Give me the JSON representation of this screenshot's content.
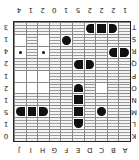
{
  "board": {
    "orientation_rotation_deg": 180,
    "columns": [
      "A",
      "B",
      "C",
      "D",
      "E",
      "F",
      "G",
      "H",
      "I",
      "J"
    ],
    "column_counts": [
      "1",
      "2",
      "2",
      "2",
      "5",
      "1",
      "0",
      "2",
      "1",
      "4"
    ],
    "rows": [
      "K",
      "L",
      "M",
      "N",
      "O",
      "P",
      "Q",
      "R",
      "S",
      "T"
    ],
    "row_counts": [
      "0",
      "1",
      "5",
      "1",
      "2",
      "1",
      "2",
      "4",
      "1",
      "3"
    ],
    "cells": [
      [
        "w",
        "w",
        "w",
        "w",
        "w",
        "w",
        "w",
        "w",
        "w",
        "w"
      ],
      [
        "w",
        "w",
        "w",
        "w",
        "st",
        "w",
        "w",
        "w",
        "w",
        "w"
      ],
      [
        "w",
        "w",
        "sub",
        "w",
        "sm",
        "w",
        "w",
        "sl",
        "sm",
        "sr"
      ],
      [
        "w",
        "w",
        "w",
        "w",
        "sm",
        "w",
        "w",
        "w",
        "w",
        "w"
      ],
      [
        "w",
        "w",
        "u",
        "w",
        "sb",
        "w",
        "w",
        "u",
        "u",
        "u"
      ],
      [
        "w",
        "w",
        "w",
        "w",
        "w",
        "w",
        "w",
        "u",
        "u",
        "u"
      ],
      [
        "w",
        "w",
        "w",
        "sl",
        "sr",
        "w",
        "w",
        "w",
        "w",
        "w"
      ],
      [
        "sl",
        "sr",
        "w",
        "w",
        "w",
        "w",
        "w",
        "d",
        "w",
        "d"
      ],
      [
        "w",
        "w",
        "w",
        "w",
        "w",
        "sub",
        "w",
        "u",
        "w",
        "u"
      ],
      [
        "w",
        "sl",
        "sm",
        "sr",
        "w",
        "w",
        "w",
        "w",
        "w",
        "w"
      ]
    ],
    "legend": {
      "w": "water",
      "u": "unknown",
      "d": "unknown-marked-dot",
      "sub": "ship-single",
      "sl": "ship-end-left",
      "sr": "ship-end-right",
      "sm": "ship-middle",
      "st": "ship-end-top",
      "sb": "ship-end-bottom"
    }
  }
}
